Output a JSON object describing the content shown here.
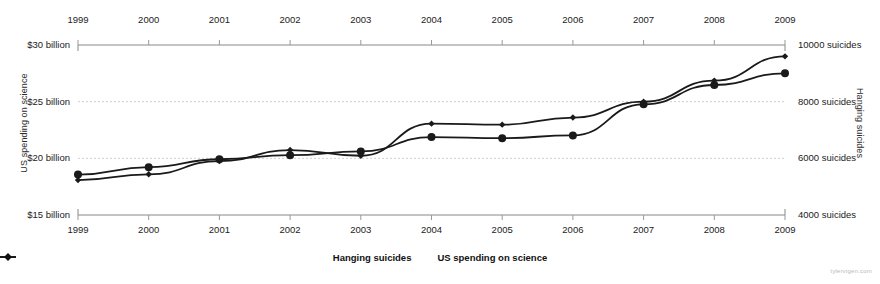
{
  "chart_data": {
    "type": "line",
    "title": "",
    "xlabel": "",
    "grid": true,
    "legend_position": "bottom-center",
    "x": [
      1999,
      2000,
      2001,
      2002,
      2003,
      2004,
      2005,
      2006,
      2007,
      2008,
      2009
    ],
    "x_tick_labels": [
      "1999",
      "2000",
      "2001",
      "2002",
      "2003",
      "2004",
      "2005",
      "2006",
      "2007",
      "2008",
      "2009"
    ],
    "axes": {
      "left": {
        "label": "US spending on science",
        "ticks": [
          15,
          20,
          25,
          30
        ],
        "tick_labels": [
          "$15 billion",
          "$20 billion",
          "$25 billion",
          "$30 billion"
        ],
        "ylim": [
          15,
          30
        ],
        "units": "billion USD"
      },
      "right": {
        "label": "Hanging suicides",
        "ticks": [
          4000,
          6000,
          8000,
          10000
        ],
        "tick_labels": [
          "4000 suicides",
          "6000 suicides",
          "8000 suicides",
          "10000 suicides"
        ],
        "ylim": [
          4000,
          10000
        ],
        "units": "suicides"
      }
    },
    "series": [
      {
        "name": "Hanging suicides",
        "axis": "right",
        "marker": "filled-diamond",
        "color": "#1a1a1a",
        "values": [
          5427,
          5688,
          5968,
          6112,
          6243,
          6751,
          6712,
          6810,
          7907,
          8589,
          9000
        ]
      },
      {
        "name": "US spending on science",
        "axis": "left",
        "marker": "small-diamond",
        "color": "#1a1a1a",
        "values": [
          18.08,
          18.59,
          19.75,
          20.73,
          20.23,
          23.06,
          22.97,
          23.6,
          25.0,
          26.86,
          29.0
        ]
      }
    ]
  },
  "legend": {
    "items": [
      {
        "label": "Hanging suicides"
      },
      {
        "label": "US spending on science"
      }
    ]
  },
  "watermark": {
    "text": "tylervigen.com"
  }
}
